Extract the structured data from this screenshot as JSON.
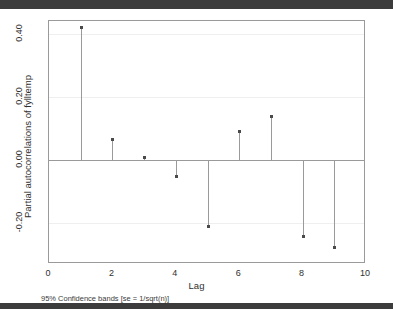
{
  "chart_data": {
    "type": "bar",
    "title": "",
    "subtitle": "",
    "xlabel": "Lag",
    "ylabel": "Partial autocorrelations of fylltemp",
    "footnote": "95% Confidence bands [se = 1/sqrt(n)]",
    "categories": [
      1,
      2,
      3,
      4,
      5,
      6,
      7,
      8,
      9
    ],
    "x": [
      1,
      2,
      3,
      4,
      5,
      6,
      7,
      8,
      9
    ],
    "values": [
      0.42,
      0.065,
      0.01,
      -0.05,
      -0.21,
      0.093,
      0.138,
      -0.24,
      -0.275
    ],
    "series": [
      {
        "name": "Partial autocorrelations of fylltemp",
        "values": [
          0.42,
          0.065,
          0.01,
          -0.05,
          -0.21,
          0.093,
          0.138,
          -0.24,
          -0.275
        ]
      }
    ],
    "xlim": [
      0,
      10
    ],
    "ylim": [
      -0.33,
      0.44
    ],
    "xticks": [
      "0",
      "2",
      "4",
      "6",
      "8",
      "10"
    ],
    "xtick_values": [
      0,
      2,
      4,
      6,
      8,
      10
    ],
    "yticks": [
      "0.40",
      "0.20",
      "0.00",
      "-0.20"
    ],
    "ytick_values": [
      0.4,
      0.2,
      0.0,
      -0.2
    ],
    "grid": true,
    "legend": false,
    "legend_position": "none",
    "zero_line": 0.0,
    "marker_color": "#4a4a4a",
    "spike_color": "#9a9a9a",
    "grid_color": "#efefef",
    "axis_color": "#9a9a9a",
    "background_color": "#ffffff"
  }
}
